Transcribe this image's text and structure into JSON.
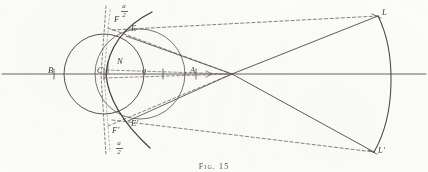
{
  "figure": {
    "caption": "Fig. 15",
    "ink_color": "#4f4a46",
    "paper_color": "#fdfdfb",
    "labels": {
      "B": "B",
      "C": "C",
      "N": "N",
      "q": "q",
      "A": "A",
      "F": "F",
      "F_prime": "F'",
      "E": "E",
      "E_prime": "E'",
      "L": "L",
      "L_prime": "L'"
    },
    "angle_fraction_top": {
      "numerator": "a",
      "denominator": "2"
    },
    "angle_fraction_bottom": {
      "numerator": "a",
      "denominator": "2"
    }
  }
}
